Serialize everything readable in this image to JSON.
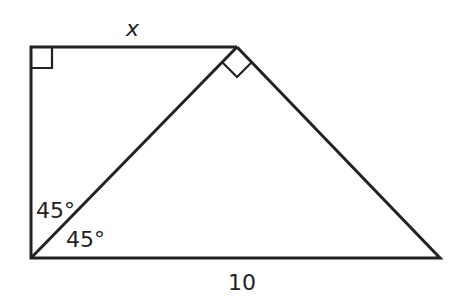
{
  "figure": {
    "labels": {
      "top_side": "x",
      "bottom_side": "10",
      "angle_upper": "45°",
      "angle_lower": "45°"
    },
    "right_angles": [
      "top-left corner",
      "apex between hypotenuse and right slant"
    ],
    "stroke_color": "#222222"
  }
}
